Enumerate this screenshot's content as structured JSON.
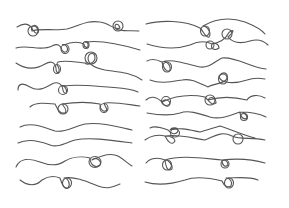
{
  "illustration": {
    "title": "Hand-drawn swirl divider set",
    "background": "#ffffff",
    "stroke_color": "#555555",
    "stroke_width": 1.1,
    "columns": [
      {
        "name": "left-column",
        "lines": [
          "M17 27 C25 22 30 24 33 30 C36 35 40 34 38 28 C36 23 30 26 32 31 C40 28 55 31 67 29 C80 26 85 20 100 22 C110 23 114 31 120 28 C118 22 113 24 116 29 C122 32 130 30 139 31",
          "M16 48 C28 44 40 52 52 46 C58 43 60 45 62 50 C64 54 69 52 67 47 C65 43 60 45 64 45 C72 41 80 42 84 44 C84 48 89 49 88 44 C87 41 84 43 86 42 C100 40 120 44 140 50",
          "M16 63 C25 69 35 70 45 64 C52 60 55 63 56 68 C56 74 60 74 59 69 C58 64 55 66 58 62 C65 60 75 62 85 63 C88 66 95 62 95 58 C95 52 89 52 88 58 C88 64 95 68 105 70 C118 72 130 72 142 80",
          "M18 90 C18 84 22 82 30 87 C38 92 45 88 52 84 C58 81 62 84 63 90 C64 95 68 94 66 89 C64 84 60 86 64 86 C78 84 92 86 108 87 C120 88 130 88 138 92",
          "M30 107 C35 102 45 103 55 104 C58 110 60 114 65 113 C68 110 64 107 62 104 C75 102 90 102 100 104 C100 110 104 113 107 110 C106 106 103 104 105 103 C115 102 125 104 140 106",
          "M20 127 C30 122 40 126 55 131 C65 133 72 127 85 124 C100 122 115 126 132 130",
          "M18 143 C28 138 40 141 50 145 C58 148 65 143 75 140 C90 137 110 140 132 143",
          "M16 167 C20 158 30 158 40 162 C50 166 58 166 65 161 C72 157 82 156 90 158 C90 164 95 169 100 165 C102 161 96 156 92 160 C100 156 110 152 118 156 C125 160 128 164 132 166",
          "M20 180 C28 186 35 187 42 180 C48 176 55 176 60 178 C62 184 64 190 68 188 C71 184 68 178 64 178 C75 176 88 182 98 186 C108 190 115 186 120 184"
        ]
      },
      {
        "name": "right-column",
        "lines": [
          "M146 24 C160 20 185 20 200 28 C205 33 205 38 209 37 C212 33 207 26 203 26 C215 19 230 17 245 22 C255 26 262 30 265 34",
          "M147 44 C160 48 175 50 190 45 C200 40 208 42 212 44 C210 49 215 51 219 48 C219 44 214 42 212 44 C222 42 226 38 228 34 C230 30 238 28 228 37 C232 42 240 44 250 41 C260 38 265 42 268 45",
          "M147 61 C152 58 158 60 162 62 C164 70 168 73 170 70 C171 65 166 60 162 62 C172 58 185 64 200 67 C210 68 215 61 222 58 C235 56 252 68 266 69",
          "M150 80 C160 84 170 82 182 80 C192 78 200 84 208 87 C212 84 222 84 226 80 C230 74 224 70 219 76 C220 84 235 84 247 80 C255 77 260 78 265 79",
          "M146 100 C150 96 156 96 162 102 C164 106 168 108 170 104 C170 100 164 98 162 102 C175 96 190 94 205 97 C210 102 212 106 216 103 C216 97 210 96 208 100 C222 96 235 97 247 100 C250 95 258 94 265 98",
          "M147 113 C158 115 170 116 180 113 C188 110 198 113 210 117 C220 120 232 115 240 112 C240 118 245 120 247 118 C247 114 243 112 240 112 C252 112 260 114 266 117",
          "M150 128 C155 125 162 128 168 130 C170 133 176 136 178 131 C178 127 172 127 170 130 C180 127 190 130 200 132 C206 130 214 128 220 126 C230 129 240 134 255 138",
          "M145 140 C150 136 158 134 165 136 C168 142 172 146 175 141 C174 136 168 136 165 136 C178 134 192 138 205 140 C212 138 220 130 232 136 C240 140 252 137 265 140",
          "M146 163 C150 158 158 157 165 160 C166 168 168 172 172 169 C173 164 168 160 165 160 C180 155 200 158 222 160 C222 165 225 168 228 165 C228 161 224 160 222 160 C240 158 255 160 265 163",
          "M145 182 C158 186 172 184 185 180 C195 176 210 178 222 181 C224 186 228 188 231 186 C233 182 230 178 226 178 C236 178 248 176 258 180"
        ]
      }
    ],
    "loops": [
      {
        "cx": 33,
        "cy": 31,
        "rx": 5,
        "ry": 5
      },
      {
        "cx": 118,
        "cy": 26,
        "rx": 5,
        "ry": 5
      },
      {
        "cx": 65,
        "cy": 49,
        "rx": 4,
        "ry": 4.5
      },
      {
        "cx": 86,
        "cy": 45,
        "rx": 3,
        "ry": 3.5
      },
      {
        "cx": 57,
        "cy": 69,
        "rx": 3.5,
        "ry": 4.5
      },
      {
        "cx": 91,
        "cy": 58,
        "rx": 6,
        "ry": 6
      },
      {
        "cx": 63,
        "cy": 90,
        "rx": 4.5,
        "ry": 4.5
      },
      {
        "cx": 63,
        "cy": 109,
        "rx": 5,
        "ry": 5
      },
      {
        "cx": 104,
        "cy": 108,
        "rx": 4,
        "ry": 4.5
      },
      {
        "cx": 95,
        "cy": 162,
        "rx": 6,
        "ry": 5.5
      },
      {
        "cx": 67,
        "cy": 183,
        "rx": 4.5,
        "ry": 5
      },
      {
        "cx": 205,
        "cy": 31,
        "rx": 4.5,
        "ry": 5
      },
      {
        "cx": 227,
        "cy": 34,
        "rx": 5,
        "ry": 5
      },
      {
        "cx": 210,
        "cy": 45,
        "rx": 4,
        "ry": 4
      },
      {
        "cx": 167,
        "cy": 67,
        "rx": 4.5,
        "ry": 5
      },
      {
        "cx": 223,
        "cy": 79,
        "rx": 4.5,
        "ry": 5
      },
      {
        "cx": 166,
        "cy": 101,
        "rx": 4.5,
        "ry": 4.5
      },
      {
        "cx": 210,
        "cy": 100,
        "rx": 5,
        "ry": 5
      },
      {
        "cx": 244,
        "cy": 117,
        "rx": 3.5,
        "ry": 3.5
      },
      {
        "cx": 175,
        "cy": 133,
        "rx": 4.5,
        "ry": 4
      },
      {
        "cx": 238,
        "cy": 139,
        "rx": 5,
        "ry": 5
      },
      {
        "cx": 167,
        "cy": 165,
        "rx": 4.5,
        "ry": 5
      },
      {
        "cx": 225,
        "cy": 164,
        "rx": 4,
        "ry": 4
      },
      {
        "cx": 229,
        "cy": 183,
        "rx": 4.5,
        "ry": 5
      }
    ]
  }
}
